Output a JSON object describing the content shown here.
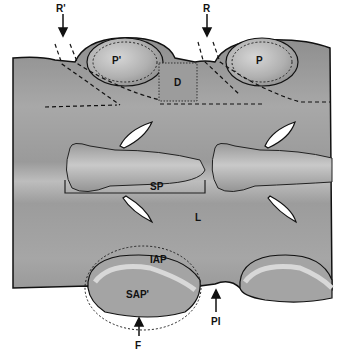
{
  "figure": {
    "labels": {
      "r_prime": "R'",
      "r": "R",
      "p_prime": "P'",
      "p": "P",
      "d": "D",
      "sp": "SP",
      "l": "L",
      "iap": "IAP",
      "sap_prime": "SAP'",
      "f": "F",
      "pi": "PI"
    },
    "colors": {
      "background": "#ffffff",
      "bone_gray": "#9a9a9a",
      "bone_light": "#c8c8c8",
      "outline": "#111111"
    }
  }
}
